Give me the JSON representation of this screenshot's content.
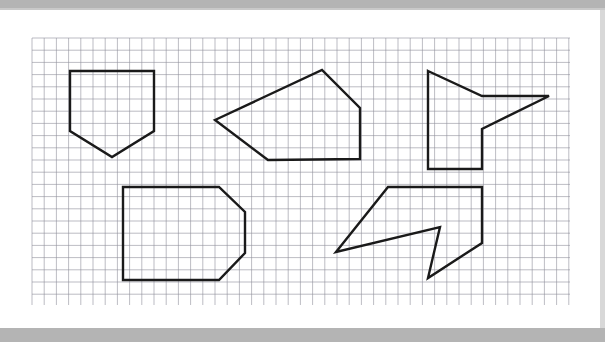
{
  "document": {
    "type": "worksheet",
    "title": "Grid paper geometry shapes worksheet",
    "page_background": "#ffffff",
    "scan_border_color": "#b4b4b4",
    "grid": {
      "line_color": "#8f8f9a",
      "line_width": 0.6,
      "cell_size_px": 12.2,
      "origin_x": 32,
      "origin_y": 38,
      "width_px": 538,
      "height_px": 267,
      "columns": 44,
      "rows": 22,
      "visible": true
    },
    "ink": {
      "stroke_color": "#1a1a1a",
      "stroke_width": 2.4,
      "fill": "none"
    },
    "shapes": [
      {
        "id": "shape-1",
        "name": "pentagon-home-plate-down",
        "sides": 5,
        "points": [
          [
            70,
            71
          ],
          [
            154,
            71
          ],
          [
            154,
            131
          ],
          [
            112,
            157
          ],
          [
            70,
            131
          ]
        ],
        "description": "Home-plate pentagon pointing downward"
      },
      {
        "id": "shape-2",
        "name": "irregular-pentagon",
        "sides": 5,
        "points": [
          [
            215,
            120
          ],
          [
            322,
            70
          ],
          [
            360,
            108
          ],
          [
            360,
            159
          ],
          [
            268,
            160
          ]
        ],
        "description": "Irregular pentagon with left point"
      },
      {
        "id": "shape-3",
        "name": "concave-arrow-right",
        "sides": 7,
        "points": [
          [
            428,
            71
          ],
          [
            482,
            96
          ],
          [
            549,
            96
          ],
          [
            482,
            129
          ],
          [
            482,
            169
          ],
          [
            428,
            169
          ]
        ],
        "description": "Concave arrow-like polygon pointing right"
      },
      {
        "id": "shape-4",
        "name": "octagon-clipped-rectangle",
        "sides": 6,
        "points": [
          [
            123,
            187
          ],
          [
            219,
            187
          ],
          [
            245,
            212
          ],
          [
            245,
            253
          ],
          [
            219,
            280
          ],
          [
            123,
            280
          ]
        ],
        "description": "Rectangle with two clipped right corners"
      },
      {
        "id": "shape-5",
        "name": "concave-lightning-arrow",
        "sides": 7,
        "points": [
          [
            388,
            187
          ],
          [
            482,
            187
          ],
          [
            482,
            243
          ],
          [
            428,
            278
          ],
          [
            440,
            227
          ],
          [
            336,
            252
          ]
        ],
        "description": "Concave lightning-bolt / arrow polygon"
      }
    ]
  }
}
